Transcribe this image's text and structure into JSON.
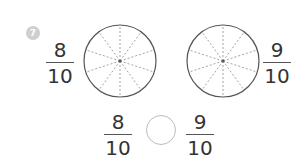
{
  "problem": {
    "number": "7",
    "left_fraction": {
      "numerator": "8",
      "denominator": "10"
    },
    "right_fraction": {
      "numerator": "9",
      "denominator": "10"
    },
    "left_circle": {
      "parts": 10
    },
    "right_circle": {
      "parts": 10
    },
    "comparison": {
      "left": {
        "numerator": "8",
        "denominator": "10"
      },
      "right": {
        "numerator": "9",
        "denominator": "10"
      },
      "answer": ""
    }
  },
  "colors": {
    "badge": "#cfcfcf",
    "stroke": "#555555",
    "dash": "#999999"
  }
}
